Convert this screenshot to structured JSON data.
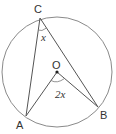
{
  "diagram": {
    "type": "circle-theorem",
    "circle": {
      "cx": 57,
      "cy": 72,
      "r": 55,
      "stroke": "#8a8a8a"
    },
    "centre": {
      "label": "O",
      "x": 57,
      "y": 72
    },
    "points": [
      {
        "label": "C",
        "x": 40,
        "y": 18
      },
      {
        "label": "A",
        "x": 26,
        "y": 116
      },
      {
        "label": "B",
        "x": 98,
        "y": 107
      }
    ],
    "angles": [
      {
        "vertex": "C",
        "label": "x"
      },
      {
        "vertex": "O",
        "label": "2x"
      }
    ],
    "line_color": "#555555"
  },
  "labels": {
    "C": "C",
    "A": "A",
    "B": "B",
    "O": "O",
    "angle_C": "x",
    "angle_O": "2x"
  }
}
